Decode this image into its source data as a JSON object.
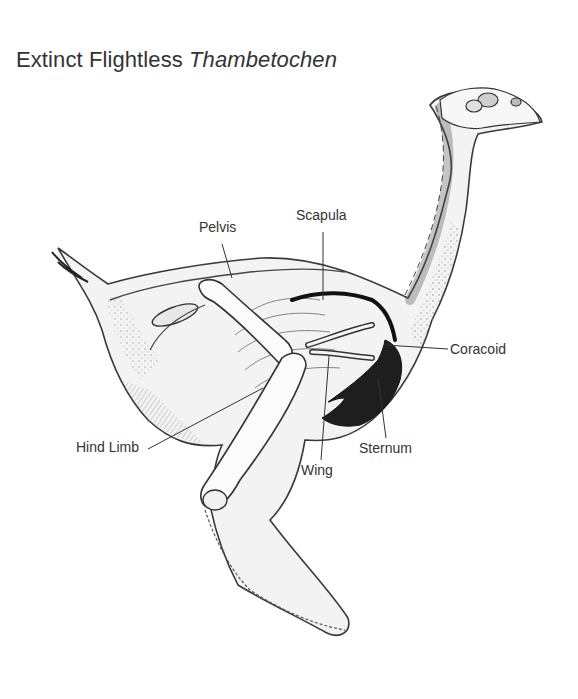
{
  "title": {
    "prefix": "Extinct Flightless",
    "species": "Thambetochen"
  },
  "labels": {
    "pelvis": "Pelvis",
    "scapula": "Scapula",
    "coracoid": "Coracoid",
    "hind_limb": "Hind Limb",
    "sternum": "Sternum",
    "wing": "Wing"
  },
  "colors": {
    "ink": "#333333",
    "sternum_fill": "#1e1e1e",
    "body_shade": "#d9d9d9",
    "background": "#ffffff"
  }
}
